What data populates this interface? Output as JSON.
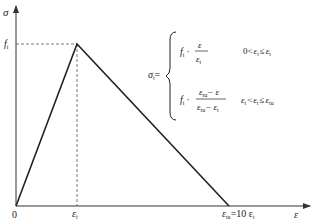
{
  "diagram": {
    "type": "stress-strain-curve",
    "axes": {
      "y_label": "σ",
      "x_label": "ε",
      "origin_label": "0"
    },
    "ticks": {
      "y_peak_label_main": "f",
      "y_peak_label_sub": "t",
      "x_peak_label_main": "ε",
      "x_peak_label_sub": "t",
      "x_end_label_main": "ε",
      "x_end_label_sub": "tu",
      "x_end_label_eq": "=10 ε",
      "x_end_label_eq_sub": "t"
    },
    "curve": {
      "points": [
        [
          0,
          0
        ],
        [
          1,
          1
        ],
        [
          10,
          0
        ]
      ],
      "description": "bilinear: linear rise to peak (ε_t, f_t), linear descent to ε_tu = 10 ε_t"
    },
    "equation": {
      "lhs_main": "σ",
      "lhs_sub": "t",
      "lhs_eq": "=",
      "case1_coef_main": "f",
      "case1_coef_sub": "t",
      "case1_dot": "·",
      "case1_num": "ε",
      "case1_den_main": "ε",
      "case1_den_sub": "t",
      "case1_cond_left": "0<",
      "case1_cond_var_main": "ε",
      "case1_cond_var_sub": "t",
      "case1_cond_op": "≤",
      "case1_cond_right_main": "ε",
      "case1_cond_right_sub": "t",
      "case2_coef_main": "f",
      "case2_coef_sub": "t",
      "case2_dot": "·",
      "case2_num_a_main": "ε",
      "case2_num_a_sub": "tu",
      "case2_num_rest": "− ε",
      "case2_den_a_main": "ε",
      "case2_den_a_sub": "tu",
      "case2_den_rest_main": "− ε",
      "case2_den_rest_sub": "t",
      "case2_cond_left_main": "ε",
      "case2_cond_left_sub": "t",
      "case2_cond_op1": "<",
      "case2_cond_var_main": "ε",
      "case2_cond_var_sub": "t",
      "case2_cond_op2": "≤",
      "case2_cond_right_main": "ε",
      "case2_cond_right_sub": "tu"
    },
    "colors": {
      "line": "#222222",
      "dashed": "#555555",
      "axis": "#333333"
    }
  }
}
